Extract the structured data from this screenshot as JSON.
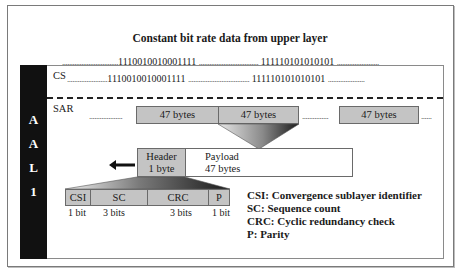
{
  "title": "Constant bit rate data from upper layer",
  "upper_stream": {
    "left_dots": "................................",
    "seg1": "1110010010001111",
    "mid_dots": "..................................",
    "seg2": "111110101010101",
    "right_dots": "........................"
  },
  "aal": {
    "letters": [
      "A",
      "A",
      "L",
      "1"
    ],
    "cs": {
      "label": "CS",
      "left_dots": ".......................",
      "seg1": "1110010010001111",
      "mid_dots": "...................................",
      "seg2": "111110101010101",
      "right_dots": "....................."
    },
    "sar": {
      "label": "SAR",
      "left_dots": "...................",
      "cells": [
        "47 bytes",
        "47 bytes",
        "47 bytes"
      ],
      "mid_dots": "...............",
      "right_dots": "......"
    },
    "pdu": {
      "header_line1": "Header",
      "header_line2": "1 byte",
      "payload_line1": "Payload",
      "payload_line2": "47 bytes"
    },
    "header_fields": [
      {
        "name": "CSI",
        "bits": "1 bit"
      },
      {
        "name": "SC",
        "bits": "3 bits"
      },
      {
        "name": "CRC",
        "bits": "3 bits"
      },
      {
        "name": "P",
        "bits": "1 bit"
      }
    ],
    "legend": [
      "CSI: Convergence sublayer identifier",
      "SC: Sequence count",
      "CRC: Cyclic redundancy check",
      "P: Parity"
    ]
  },
  "colors": {
    "cell_fill": "#c4c4c4",
    "sidebar": "#111111",
    "border": "#6a6a6a"
  }
}
